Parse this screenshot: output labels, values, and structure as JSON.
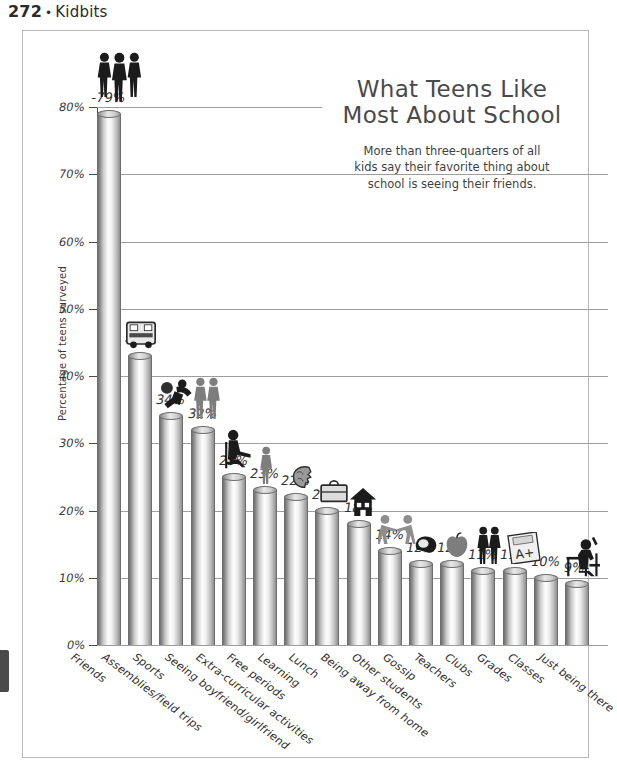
{
  "page": {
    "folio": "272",
    "separator": "•",
    "book_title": "Kidbits"
  },
  "chart_data": {
    "type": "bar",
    "title": "What Teens Like Most About School",
    "title_line1": "What Teens Like",
    "title_line2": "Most About School",
    "subtitle": "More than three-quarters of all kids say their favorite thing about school is seeing their friends.",
    "subtitle_line1": "More than three-quarters of all",
    "subtitle_line2": "kids say their favorite thing about",
    "subtitle_line3": "school is seeing their friends.",
    "xlabel": "",
    "ylabel": "Percentage of teens surveyed",
    "ylim": [
      0,
      80
    ],
    "grid": true,
    "legend": "none",
    "ytick_labels": [
      "0%",
      "10%",
      "20%",
      "30%",
      "40%",
      "50%",
      "60%",
      "70%",
      "80%"
    ],
    "ytick_values": [
      0,
      10,
      20,
      30,
      40,
      50,
      60,
      70,
      80
    ],
    "categories": [
      "Friends",
      "Assemblies/field trips",
      "Sports",
      "Seeing boyfriend/girlfriend",
      "Extra-curricular activities",
      "Free periods",
      "Learning",
      "Lunch",
      "Being away from home",
      "Other students",
      "Gossip",
      "Teachers",
      "Clubs",
      "Grades",
      "Classes",
      "Just being there"
    ],
    "values": [
      79,
      43,
      34,
      32,
      25,
      23,
      22,
      20,
      18,
      14,
      12,
      12,
      11,
      11,
      10,
      9
    ],
    "value_labels": [
      "-79%",
      "43%",
      "34%",
      "32%",
      "25%",
      "23%",
      "22%",
      "20%",
      "18%",
      "14%",
      "12%",
      "12%",
      "11%",
      "11%",
      "10%",
      "9%-"
    ],
    "icons": [
      {
        "name": "three-teens-icon",
        "category": "Friends"
      },
      {
        "name": "school-bus-icon",
        "category": "Assemblies/field trips"
      },
      {
        "name": "basketball-player-icon",
        "category": "Sports"
      },
      {
        "name": "couple-icon",
        "category": "Seeing boyfriend/girlfriend"
      },
      {
        "name": "student-reading-chair-icon",
        "category": "Extra-curricular activities"
      },
      {
        "name": "standing-person-icon",
        "category": "Free periods"
      },
      {
        "name": "brain-head-icon",
        "category": "Learning"
      },
      {
        "name": "lunchbox-icon",
        "category": "Lunch"
      },
      {
        "name": "house-icon",
        "category": "Being away from home"
      },
      {
        "name": "two-students-running-icon",
        "category": "Other students"
      },
      {
        "name": "telephone-icon",
        "category": "Gossip"
      },
      {
        "name": "apple-icon",
        "category": "Teachers"
      },
      {
        "name": "two-people-icon",
        "category": "Clubs"
      },
      {
        "name": "report-card-a-plus-icon",
        "category": "Grades"
      },
      {
        "name": "student-at-desk-icon",
        "category": "Just being there"
      }
    ],
    "colors": {
      "bar_light": "#fdfdfd",
      "bar_dark": "#707070",
      "outline": "#6d6d6d",
      "grid": "#9d9d9d",
      "text": "#3a3a3a",
      "title": "#4a4a4a"
    }
  }
}
